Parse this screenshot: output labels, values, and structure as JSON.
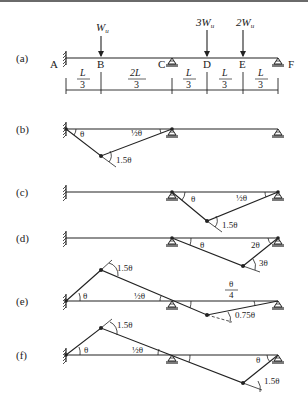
{
  "figure": {
    "panels": [
      {
        "id": "a",
        "label": "(a)"
      },
      {
        "id": "b",
        "label": "(b)"
      },
      {
        "id": "c",
        "label": "(c)"
      },
      {
        "id": "d",
        "label": "(d)"
      },
      {
        "id": "e",
        "label": "(e)"
      },
      {
        "id": "f",
        "label": "(f)"
      }
    ],
    "points": {
      "A": "A",
      "B": "B",
      "C": "C",
      "D": "D",
      "E": "E",
      "F": "F"
    },
    "loads": {
      "B": "W",
      "D": "3W",
      "E": "2W",
      "sub": "u"
    },
    "spans": [
      {
        "num": "L",
        "den": "3"
      },
      {
        "num": "2L",
        "den": "3"
      },
      {
        "num": "L",
        "den": "3"
      },
      {
        "num": "L",
        "den": "3"
      },
      {
        "num": "L",
        "den": "3"
      }
    ],
    "angles": {
      "b": {
        "left": "θ",
        "right": "½θ",
        "hinge": "1.5θ"
      },
      "c": {
        "left": "θ",
        "right": "½θ",
        "hinge": "1.5θ"
      },
      "d": {
        "left": "θ",
        "right": "2θ",
        "hinge": "3θ"
      },
      "e": {
        "left": "θ",
        "mid": "½θ",
        "frac_num": "θ",
        "frac_den": "4",
        "hinge_top": "1.5θ",
        "hinge_bottom": "0.75θ"
      },
      "f": {
        "left": "θ",
        "mid": "½θ",
        "right": "θ",
        "hinge_top": "1.5θ",
        "hinge_bottom": "1.5θ"
      }
    }
  }
}
